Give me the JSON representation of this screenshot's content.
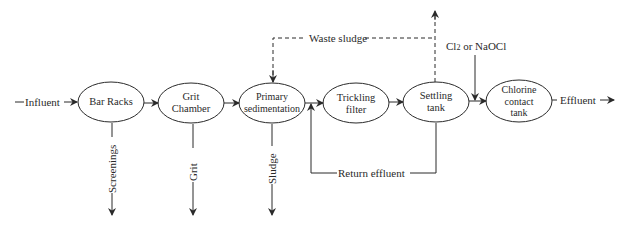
{
  "diagram": {
    "type": "process-flow",
    "title": "",
    "colors": {
      "line": "#2a2a2a",
      "background": "#ffffff"
    },
    "input_label": "Influent",
    "output_label": "Effluent",
    "nodes": [
      {
        "id": "bar-racks",
        "label": "Bar Racks"
      },
      {
        "id": "grit-chamber",
        "label_line1": "Grit",
        "label_line2": "Chamber"
      },
      {
        "id": "primary-sedimentation",
        "label_line1": "Primary",
        "label_line2": "sedimentation"
      },
      {
        "id": "trickling-filter",
        "label_line1": "Trickling",
        "label_line2": "filter"
      },
      {
        "id": "settling-tank",
        "label_line1": "Settling",
        "label_line2": "tank"
      },
      {
        "id": "chlorine-contact-tank",
        "label_line1": "Chlorine",
        "label_line2": "contact",
        "label_line3": "tank"
      }
    ],
    "side_outputs": {
      "screenings": "Screenings",
      "grit": "Grit",
      "sludge": "Sludge"
    },
    "waste_sludge_label": "Waste sludge",
    "return_effluent_label": "Return effluent",
    "chemical_input": {
      "prefix": "Cl",
      "subscript": "2",
      "suffix": " or NaOCl"
    },
    "edges": [
      {
        "from": "Influent",
        "to": "bar-racks"
      },
      {
        "from": "bar-racks",
        "to": "grit-chamber"
      },
      {
        "from": "grit-chamber",
        "to": "primary-sedimentation"
      },
      {
        "from": "primary-sedimentation",
        "to": "trickling-filter"
      },
      {
        "from": "trickling-filter",
        "to": "settling-tank"
      },
      {
        "from": "settling-tank",
        "to": "chlorine-contact-tank"
      },
      {
        "from": "chlorine-contact-tank",
        "to": "Effluent"
      },
      {
        "from": "bar-racks",
        "to": "Screenings"
      },
      {
        "from": "grit-chamber",
        "to": "Grit"
      },
      {
        "from": "primary-sedimentation",
        "to": "Sludge"
      },
      {
        "from": "settling-tank",
        "to": "primary-sedimentation",
        "label": "Waste sludge",
        "style": "dashed"
      },
      {
        "from": "settling-tank",
        "to": "out-top",
        "style": "dashed"
      },
      {
        "from": "settling-tank",
        "to": "trickling-filter-inlet",
        "label": "Return effluent"
      },
      {
        "from": "Cl2 or NaOCl",
        "to": "chlorine-contact-tank-inlet"
      }
    ]
  }
}
